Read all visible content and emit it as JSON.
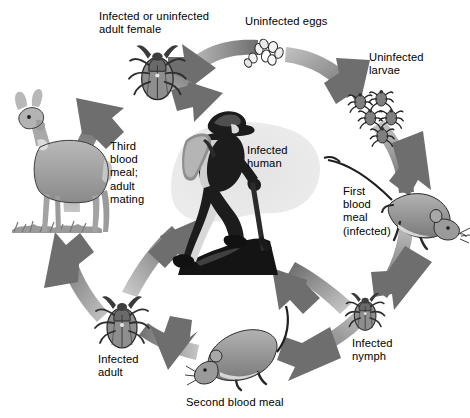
{
  "figure": {
    "type": "cycle-diagram",
    "background_color": "#ffffff",
    "arrow_color_dark": "#6e6e6e",
    "arrow_color_light": "#b8b8b8",
    "text_color": "#000000"
  },
  "labels": {
    "adult_female": "Infected or uninfected\nadult female",
    "uninfected_eggs": "Uninfected eggs",
    "uninfected_larvae": "Uninfected\nlarvae",
    "first_blood_meal": "First\nblood\nmeal\n(infected)",
    "infected_nymph": "Infected\nnymph",
    "second_blood_meal": "Second blood meal",
    "infected_adult": "Infected\nadult",
    "third_blood_meal": "Third\nblood\nmeal;\nadult\nmating",
    "infected_human": "Infected\nhuman"
  },
  "illustrations": {
    "adult_female_tick": "tick-icon",
    "egg_cluster": "eggs-icon",
    "larvae_cluster": "larvae-icon",
    "mouse_right": "mouse-icon",
    "nymph_tick": "tick-nymph-icon",
    "mouse_bottom": "mouse-icon",
    "adult_tick": "tick-icon",
    "deer": "deer-icon",
    "hiker": "human-hiker-icon"
  },
  "cycle_stages": [
    "Infected or uninfected adult female",
    "Uninfected eggs",
    "Uninfected larvae",
    "First blood meal (infected)",
    "Infected nymph",
    "Second blood meal",
    "Infected adult",
    "Third blood meal; adult mating"
  ]
}
